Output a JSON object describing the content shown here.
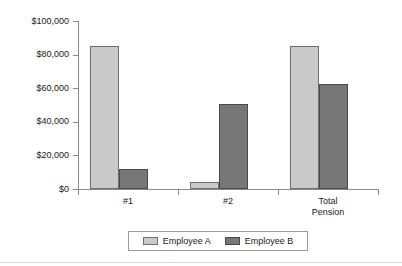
{
  "chart_data": {
    "type": "bar",
    "title": "",
    "subtitle": "",
    "xlabel": "",
    "ylabel": "",
    "categories": [
      "#1",
      "#2",
      "Total Pension"
    ],
    "category_lines": [
      [
        "#1"
      ],
      [
        "#2"
      ],
      [
        "Total",
        "Pension"
      ]
    ],
    "series": [
      {
        "name": "Employee A",
        "color": "#c9c9c9",
        "values": [
          85000,
          4000,
          85000
        ]
      },
      {
        "name": "Employee B",
        "color": "#777777",
        "values": [
          12000,
          50500,
          62500
        ]
      }
    ],
    "ylim": [
      0,
      100000
    ],
    "ytick_values": [
      0,
      20000,
      40000,
      60000,
      80000,
      100000
    ],
    "ytick_labels": [
      "$0",
      "$20,000",
      "$40,000",
      "$60,000",
      "$80,000",
      "$100,000"
    ],
    "grid": false,
    "legend_position": "bottom",
    "legend_entries": [
      "Employee A",
      "Employee B"
    ]
  }
}
